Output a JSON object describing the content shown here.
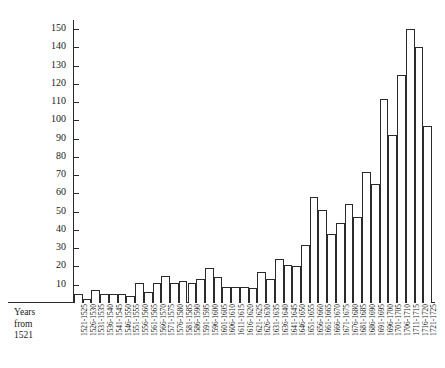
{
  "chart_data": {
    "type": "bar",
    "title": "",
    "subtitle": "",
    "xlabel": "Years from 1521",
    "ylabel": "Number of titles",
    "ylim": [
      0,
      155
    ],
    "yticks": [
      10,
      20,
      30,
      40,
      50,
      60,
      70,
      80,
      90,
      100,
      110,
      120,
      130,
      140,
      150
    ],
    "grid": false,
    "legend": null,
    "categories": [
      "1521-1525",
      "1526-1530",
      "1531-1535",
      "1536-1540",
      "1541-1545",
      "1546-1550",
      "1551-1555",
      "1556-1560",
      "1561-1565",
      "1566-1570",
      "1571-1575",
      "1576-1580",
      "1581-1585",
      "1586-1590",
      "1591-1595",
      "1596-1600",
      "1601-1605",
      "1606-1610",
      "1611-1615",
      "1616-1620",
      "1621-1625",
      "1626-1630",
      "1631-1635",
      "1636-1640",
      "1641-1645",
      "1646-1650",
      "1651-1655",
      "1656-1660",
      "1661-1665",
      "1666-1670",
      "1671-1675",
      "1676-1680",
      "1681-1685",
      "1686-1690",
      "1691-1695",
      "1696-1700",
      "1701-1705",
      "1706-1710",
      "1711-1715",
      "1716-1720",
      "1721-1725"
    ],
    "values": [
      5,
      2,
      7,
      5,
      5,
      5,
      4,
      11,
      6,
      11,
      15,
      11,
      12,
      11,
      13,
      19,
      14,
      9,
      9,
      9,
      8,
      17,
      13,
      24,
      21,
      20,
      32,
      58,
      51,
      38,
      44,
      54,
      47,
      72,
      65,
      112,
      92,
      125,
      150,
      140,
      97
    ],
    "bar_style": {
      "fill": "#ffffff",
      "stroke": "#2b2b2b"
    },
    "axis_color": "#2b2b2b"
  },
  "corner": {
    "line1": "Years",
    "line2": "from",
    "line3": "1521"
  }
}
